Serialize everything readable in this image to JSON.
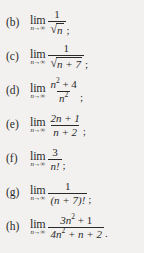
{
  "document": {
    "kind": "math-exercise-list",
    "background_color": "#f2f1ef",
    "text_color": "#2a2a2a"
  },
  "notation": {
    "lim_word": "lim",
    "lim_subscript_var": "n",
    "lim_subscript_arrow": "→",
    "lim_subscript_limit": "∞",
    "radical_sign": "√"
  },
  "items": [
    {
      "label": "(b)",
      "numerator": "1",
      "denominator_radicand": "n",
      "denominator_is_radical": true,
      "punctuation": ";"
    },
    {
      "label": "(c)",
      "numerator": "1",
      "denominator_radicand": "n + 7",
      "denominator_is_radical": true,
      "punctuation": ";"
    },
    {
      "label": "(d)",
      "numerator_base": "n",
      "numerator_exp": "2",
      "numerator_tail": " + 4",
      "denominator_base": "n",
      "denominator_exp": "2",
      "denominator_tail": "",
      "punctuation": ";"
    },
    {
      "label": "(e)",
      "numerator": "2n + 1",
      "denominator": "n + 2",
      "punctuation": ";"
    },
    {
      "label": "(f)",
      "numerator": "3",
      "denominator": "n!",
      "punctuation": ";"
    },
    {
      "label": "(g)",
      "numerator": "1",
      "denominator": "(n + 7)!",
      "punctuation": ";"
    },
    {
      "label": "(h)",
      "numerator_base": "3n",
      "numerator_exp": "2",
      "numerator_tail": " + 1",
      "denominator_base": "4n",
      "denominator_exp": "2",
      "denominator_tail": " + n + 2",
      "punctuation": "."
    }
  ]
}
